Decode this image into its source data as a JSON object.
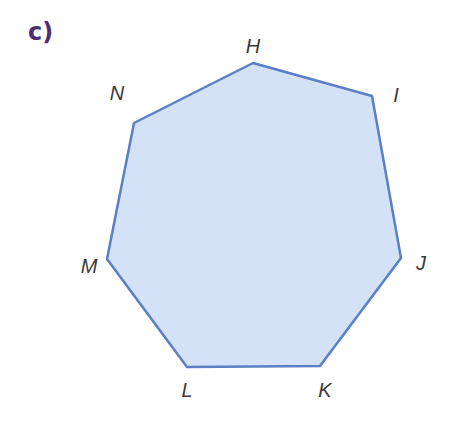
{
  "part_label": "c)",
  "shape": {
    "type": "heptagon",
    "fill": "#d3e2f6",
    "stroke": "#5b7fc4",
    "vertices": [
      {
        "name": "H",
        "x": 253,
        "y": 63,
        "lx": 253,
        "ly": 53
      },
      {
        "name": "I",
        "x": 372,
        "y": 96,
        "lx": 396,
        "ly": 102
      },
      {
        "name": "J",
        "x": 401,
        "y": 258,
        "lx": 421,
        "ly": 270
      },
      {
        "name": "K",
        "x": 320,
        "y": 366,
        "lx": 325,
        "ly": 397
      },
      {
        "name": "L",
        "x": 187,
        "y": 367,
        "lx": 187,
        "ly": 397
      },
      {
        "name": "M",
        "x": 107,
        "y": 259,
        "lx": 89,
        "ly": 273
      },
      {
        "name": "N",
        "x": 134,
        "y": 123,
        "lx": 117,
        "ly": 100
      }
    ]
  }
}
